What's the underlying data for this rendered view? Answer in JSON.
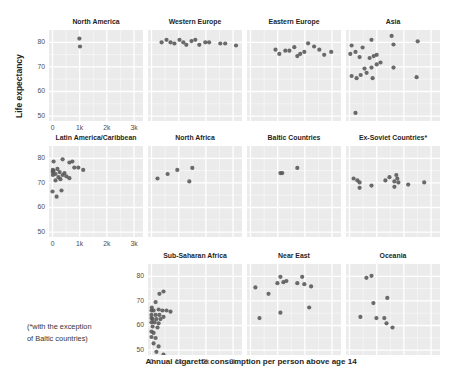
{
  "figure": {
    "ylabel": "Life expectancy",
    "xlabel": "Annual cigarette consumption per person above age 14",
    "footnote_line1": "(*with the exception",
    "footnote_line2": "of Baltic countries)",
    "colors": {
      "background": "#ffffff",
      "panel_bg": "#ebebeb",
      "grid_major": "#ffffff",
      "grid_minor": "#f6f6f6",
      "point": "#575757",
      "title_text": "#1f1f1f",
      "tick_text": "#4d4d4d"
    }
  },
  "chart_data": {
    "type": "scatter",
    "title": "",
    "xlabel": "Annual cigarette consumption per person above age 14",
    "ylabel": "Life expectancy",
    "x_domain": [
      -130,
      3330
    ],
    "y_domain": [
      48,
      85
    ],
    "x_ticks": [
      {
        "v": 0,
        "label": "0"
      },
      {
        "v": 1000,
        "label": "1k"
      },
      {
        "v": 2000,
        "label": "2k"
      },
      {
        "v": 3000,
        "label": "3k"
      }
    ],
    "y_ticks": [
      {
        "v": 50,
        "label": "50"
      },
      {
        "v": 60,
        "label": "60"
      },
      {
        "v": 70,
        "label": "70"
      },
      {
        "v": 80,
        "label": "80"
      }
    ],
    "x_minor": [
      500,
      1500,
      2500
    ],
    "y_minor": [
      55,
      65,
      75
    ],
    "grid": true,
    "legend": "none",
    "facets": [
      {
        "name": "North America",
        "row": 0,
        "col": 0,
        "axes": true,
        "points": [
          [
            990,
            81.5
          ],
          [
            1010,
            78.3
          ]
        ]
      },
      {
        "name": "Western Europe",
        "row": 0,
        "col": 1,
        "axes": false,
        "points": [
          [
            370,
            80
          ],
          [
            550,
            81
          ],
          [
            700,
            80
          ],
          [
            840,
            79.5
          ],
          [
            1030,
            81
          ],
          [
            1170,
            80
          ],
          [
            1280,
            79
          ],
          [
            1470,
            80.5
          ],
          [
            1610,
            81
          ],
          [
            1760,
            79
          ],
          [
            1980,
            80
          ],
          [
            2120,
            80
          ],
          [
            2530,
            79.5
          ],
          [
            2710,
            79.5
          ],
          [
            3110,
            78.7
          ]
        ]
      },
      {
        "name": "Eastern Europe",
        "row": 0,
        "col": 2,
        "axes": false,
        "points": [
          [
            920,
            77
          ],
          [
            1060,
            75.3
          ],
          [
            1280,
            76.6
          ],
          [
            1430,
            76.6
          ],
          [
            1610,
            78
          ],
          [
            1720,
            74.4
          ],
          [
            1830,
            75.3
          ],
          [
            1980,
            76.1
          ],
          [
            2120,
            79.6
          ],
          [
            2340,
            78.3
          ],
          [
            2530,
            77
          ],
          [
            2710,
            74.9
          ],
          [
            2970,
            76.1
          ]
        ]
      },
      {
        "name": "Asia",
        "row": 0,
        "col": 3,
        "axes": false,
        "points": [
          [
            810,
            81
          ],
          [
            1550,
            82.6
          ],
          [
            1620,
            79.1
          ],
          [
            2510,
            80.4
          ],
          [
            30,
            75.3
          ],
          [
            75,
            78.7
          ],
          [
            220,
            76.1
          ],
          [
            480,
            77.9
          ],
          [
            370,
            74
          ],
          [
            740,
            73.6
          ],
          [
            890,
            74.4
          ],
          [
            1000,
            74.9
          ],
          [
            1140,
            71.8
          ],
          [
            1000,
            71
          ],
          [
            810,
            69.7
          ],
          [
            550,
            69.3
          ],
          [
            630,
            67.6
          ],
          [
            75,
            66.3
          ],
          [
            260,
            65.4
          ],
          [
            410,
            66.7
          ],
          [
            850,
            65.4
          ],
          [
            1620,
            69.7
          ],
          [
            2470,
            65.8
          ],
          [
            220,
            51.3
          ]
        ]
      },
      {
        "name": "Latin America/Caribbean",
        "row": 1,
        "col": 0,
        "axes": true,
        "points": [
          [
            40,
            78.7
          ],
          [
            370,
            79.6
          ],
          [
            620,
            78.3
          ],
          [
            730,
            78.7
          ],
          [
            800,
            76.2
          ],
          [
            10,
            75.3
          ],
          [
            40,
            74.9
          ],
          [
            180,
            75.7
          ],
          [
            260,
            74.4
          ],
          [
            110,
            73.6
          ],
          [
            15,
            73.2
          ],
          [
            5,
            74.4
          ],
          [
            220,
            72.3
          ],
          [
            370,
            73.2
          ],
          [
            440,
            74
          ],
          [
            510,
            72.7
          ],
          [
            620,
            71.9
          ],
          [
            290,
            71.5
          ],
          [
            110,
            71
          ],
          [
            950,
            76.2
          ],
          [
            1130,
            75.3
          ],
          [
            0,
            66.5
          ],
          [
            330,
            66.9
          ],
          [
            150,
            64.4
          ]
        ]
      },
      {
        "name": "North Africa",
        "row": 1,
        "col": 1,
        "axes": false,
        "points": [
          [
            220,
            71.8
          ],
          [
            590,
            73.6
          ],
          [
            950,
            75.3
          ],
          [
            1500,
            76.1
          ],
          [
            1390,
            70.6
          ]
        ]
      },
      {
        "name": "Baltic Countries",
        "row": 1,
        "col": 2,
        "axes": false,
        "points": [
          [
            1100,
            74
          ],
          [
            1170,
            74
          ],
          [
            1720,
            76.1
          ]
        ]
      },
      {
        "name": "Ex-Soviet Countries*",
        "row": 1,
        "col": 3,
        "axes": false,
        "points": [
          [
            150,
            71.8
          ],
          [
            290,
            71
          ],
          [
            370,
            70.2
          ],
          [
            370,
            68
          ],
          [
            810,
            68.9
          ],
          [
            1320,
            71
          ],
          [
            1470,
            72.3
          ],
          [
            1650,
            70.6
          ],
          [
            1720,
            73.2
          ],
          [
            1760,
            71.8
          ],
          [
            1800,
            70.2
          ],
          [
            1650,
            68.4
          ],
          [
            2160,
            69.3
          ],
          [
            2750,
            70.2
          ]
        ]
      },
      {
        "name": "Sub-Saharan Africa",
        "row": 2,
        "col": 1,
        "axes": true,
        "points": [
          [
            290,
            72.9
          ],
          [
            440,
            73.8
          ],
          [
            150,
            69.5
          ],
          [
            10,
            67.3
          ],
          [
            0,
            66.1
          ],
          [
            75,
            66.1
          ],
          [
            260,
            66.5
          ],
          [
            400,
            66.1
          ],
          [
            550,
            66.1
          ],
          [
            700,
            65.6
          ],
          [
            0,
            64.3
          ],
          [
            150,
            64.3
          ],
          [
            290,
            64.3
          ],
          [
            0,
            63
          ],
          [
            40,
            62.6
          ],
          [
            180,
            62.6
          ],
          [
            330,
            62.6
          ],
          [
            440,
            63.5
          ],
          [
            0,
            61.3
          ],
          [
            110,
            61.3
          ],
          [
            260,
            60.9
          ],
          [
            40,
            59.6
          ],
          [
            220,
            59.2
          ],
          [
            0,
            57.5
          ],
          [
            75,
            57
          ],
          [
            0,
            55.3
          ],
          [
            150,
            54.9
          ],
          [
            75,
            52.7
          ],
          [
            260,
            51.5
          ],
          [
            180,
            49.3
          ],
          [
            440,
            48.2
          ]
        ]
      },
      {
        "name": "Near East",
        "row": 2,
        "col": 2,
        "axes": false,
        "points": [
          [
            180,
            75.5
          ],
          [
            660,
            72.9
          ],
          [
            990,
            77.2
          ],
          [
            1100,
            79.8
          ],
          [
            1210,
            77.6
          ],
          [
            1320,
            78.1
          ],
          [
            1720,
            77.2
          ],
          [
            1900,
            79.8
          ],
          [
            1980,
            76.8
          ],
          [
            2230,
            75.9
          ],
          [
            2160,
            67.3
          ],
          [
            1100,
            65.2
          ],
          [
            330,
            63
          ]
        ]
      },
      {
        "name": "Oceania",
        "row": 2,
        "col": 3,
        "axes": false,
        "points": [
          [
            620,
            79.4
          ],
          [
            810,
            80.2
          ],
          [
            1390,
            71.2
          ],
          [
            880,
            69.1
          ],
          [
            400,
            63.5
          ],
          [
            990,
            63
          ],
          [
            1280,
            63
          ],
          [
            1360,
            60.9
          ],
          [
            1580,
            59.2
          ]
        ]
      }
    ]
  }
}
